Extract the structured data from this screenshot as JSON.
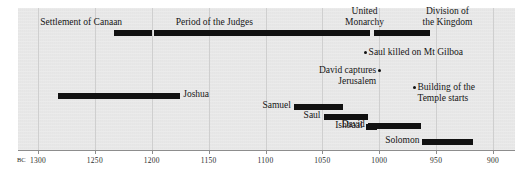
{
  "chart_data": {
    "type": "table",
    "title": "",
    "xlabel": "BC",
    "axis": {
      "prefix": "BC",
      "min": 1300,
      "max": 900,
      "direction": "descending",
      "ticks": [
        1300,
        1250,
        1200,
        1150,
        1100,
        1050,
        1000,
        950,
        900
      ],
      "tick_labels": [
        "1300",
        "1250",
        "1200",
        "1150",
        "1100",
        "1050",
        "1000",
        "950",
        "900"
      ],
      "grid": true
    },
    "eras": [
      {
        "label": "Settlement of Canaan",
        "start": 1233,
        "end": 1200,
        "label_center": 1262
      },
      {
        "label": "Period of the Judges",
        "start": 1198,
        "end": 1050,
        "label_center": 1145
      },
      {
        "label": "United\nMonarchy",
        "start": 1050,
        "end": 1008,
        "label_center": 1013
      },
      {
        "label": "Division of\nthe Kingdom",
        "start": 1005,
        "end": 955,
        "label_center": 940
      }
    ],
    "spans": [
      {
        "label": "Joshua",
        "start": 1282,
        "end": 1175,
        "label_side": "right"
      },
      {
        "label": "Samuel",
        "start": 1075,
        "end": 1032,
        "label_side": "left"
      },
      {
        "label": "Saul",
        "start": 1049,
        "end": 1010,
        "label_side": "left"
      },
      {
        "label": "David",
        "start": 1010,
        "end": 963,
        "label_side": "left"
      },
      {
        "label": "Ishbaal",
        "start": 1012,
        "end": 1002,
        "label_side": "left"
      },
      {
        "label": "Solomon",
        "start": 962,
        "end": 918,
        "label_side": "left"
      }
    ],
    "events": [
      {
        "label": "Saul killed on Mt Gilboa",
        "year": 1012,
        "label_side": "right"
      },
      {
        "label": "David captures\nJerusalem",
        "year": 1000,
        "label_side": "left"
      },
      {
        "label": "Building of the\nTemple starts",
        "year": 969,
        "label_side": "right"
      }
    ]
  }
}
